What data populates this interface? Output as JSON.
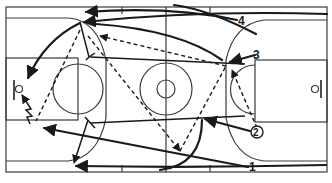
{
  "diagram": {
    "type": "basketball-court-play",
    "colors": {
      "lines": "#3a3a3a",
      "paths": "#1a1a1a",
      "background": "#ffffff"
    },
    "players": [
      {
        "label": "1",
        "circled": false
      },
      {
        "label": "2",
        "circled": true
      },
      {
        "label": "3",
        "circled": false
      },
      {
        "label": "4",
        "circled": false
      }
    ]
  }
}
